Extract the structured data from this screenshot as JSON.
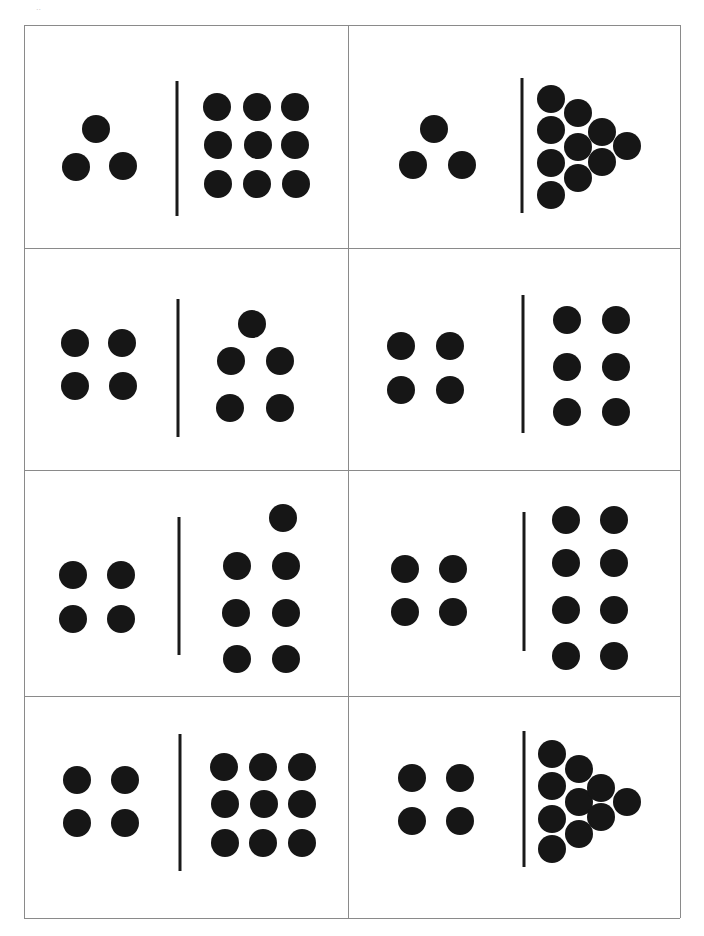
{
  "sheet": {
    "corner_mark": "..",
    "border_color": "#8a8a8a",
    "dot_color": "#161616",
    "frame": {
      "left": 24,
      "top": 25,
      "right": 680,
      "bottom": 918,
      "col_split": 348,
      "row_splits": [
        248,
        470,
        696
      ]
    }
  },
  "cards": [
    {
      "id": "card-1",
      "left_count": 3,
      "right_count": 9,
      "divider": {
        "x": 177,
        "y1": 81,
        "y2": 216
      },
      "left_dots": [
        [
          96,
          129
        ],
        [
          76,
          167
        ],
        [
          123,
          166
        ]
      ],
      "right_dots": [
        [
          217,
          107
        ],
        [
          257,
          107
        ],
        [
          295,
          107
        ],
        [
          218,
          145
        ],
        [
          258,
          145
        ],
        [
          295,
          145
        ],
        [
          218,
          184
        ],
        [
          257,
          184
        ],
        [
          296,
          184
        ]
      ]
    },
    {
      "id": "card-2",
      "left_count": 3,
      "right_count": 12,
      "divider": {
        "x": 522,
        "y1": 78,
        "y2": 213
      },
      "left_dots": [
        [
          434,
          129
        ],
        [
          413,
          165
        ],
        [
          462,
          165
        ]
      ],
      "right_dots": [
        [
          551,
          99
        ],
        [
          551,
          130
        ],
        [
          551,
          163
        ],
        [
          551,
          195
        ],
        [
          578,
          113
        ],
        [
          578,
          147
        ],
        [
          578,
          178
        ],
        [
          602,
          132
        ],
        [
          602,
          162
        ],
        [
          627,
          146
        ]
      ]
    },
    {
      "id": "card-3",
      "left_count": 4,
      "right_count": 5,
      "divider": {
        "x": 178,
        "y1": 299,
        "y2": 437
      },
      "left_dots": [
        [
          75,
          343
        ],
        [
          122,
          343
        ],
        [
          75,
          386
        ],
        [
          123,
          386
        ]
      ],
      "right_dots": [
        [
          252,
          324
        ],
        [
          231,
          361
        ],
        [
          280,
          361
        ],
        [
          230,
          408
        ],
        [
          280,
          408
        ]
      ]
    },
    {
      "id": "card-4",
      "left_count": 4,
      "right_count": 6,
      "divider": {
        "x": 523,
        "y1": 295,
        "y2": 433
      },
      "left_dots": [
        [
          401,
          346
        ],
        [
          450,
          346
        ],
        [
          401,
          390
        ],
        [
          450,
          390
        ]
      ],
      "right_dots": [
        [
          567,
          320
        ],
        [
          616,
          320
        ],
        [
          567,
          367
        ],
        [
          616,
          367
        ],
        [
          567,
          412
        ],
        [
          616,
          412
        ]
      ]
    },
    {
      "id": "card-5",
      "left_count": 4,
      "right_count": 7,
      "divider": {
        "x": 179,
        "y1": 517,
        "y2": 655
      },
      "left_dots": [
        [
          73,
          575
        ],
        [
          121,
          575
        ],
        [
          73,
          619
        ],
        [
          121,
          619
        ]
      ],
      "right_dots": [
        [
          283,
          518
        ],
        [
          237,
          566
        ],
        [
          286,
          566
        ],
        [
          236,
          613
        ],
        [
          286,
          613
        ],
        [
          237,
          659
        ],
        [
          286,
          659
        ]
      ]
    },
    {
      "id": "card-6",
      "left_count": 4,
      "right_count": 8,
      "divider": {
        "x": 524,
        "y1": 512,
        "y2": 651
      },
      "left_dots": [
        [
          405,
          569
        ],
        [
          453,
          569
        ],
        [
          405,
          612
        ],
        [
          453,
          612
        ]
      ],
      "right_dots": [
        [
          566,
          520
        ],
        [
          614,
          520
        ],
        [
          566,
          563
        ],
        [
          614,
          563
        ],
        [
          566,
          610
        ],
        [
          614,
          610
        ],
        [
          566,
          656
        ],
        [
          614,
          656
        ]
      ]
    },
    {
      "id": "card-7",
      "left_count": 4,
      "right_count": 9,
      "divider": {
        "x": 180,
        "y1": 734,
        "y2": 871
      },
      "left_dots": [
        [
          77,
          780
        ],
        [
          125,
          780
        ],
        [
          77,
          823
        ],
        [
          125,
          823
        ]
      ],
      "right_dots": [
        [
          224,
          767
        ],
        [
          263,
          767
        ],
        [
          302,
          767
        ],
        [
          225,
          804
        ],
        [
          264,
          804
        ],
        [
          302,
          804
        ],
        [
          225,
          843
        ],
        [
          263,
          843
        ],
        [
          302,
          843
        ]
      ]
    },
    {
      "id": "card-8",
      "left_count": 4,
      "right_count": 11,
      "divider": {
        "x": 524,
        "y1": 731,
        "y2": 867
      },
      "left_dots": [
        [
          412,
          778
        ],
        [
          460,
          778
        ],
        [
          412,
          821
        ],
        [
          460,
          821
        ]
      ],
      "right_dots": [
        [
          552,
          754
        ],
        [
          552,
          786
        ],
        [
          552,
          819
        ],
        [
          552,
          849
        ],
        [
          579,
          769
        ],
        [
          579,
          802
        ],
        [
          579,
          834
        ],
        [
          601,
          788
        ],
        [
          601,
          817
        ],
        [
          627,
          802
        ]
      ]
    }
  ]
}
